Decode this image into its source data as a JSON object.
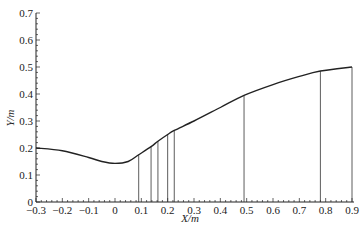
{
  "chart_data": {
    "type": "line",
    "title": "",
    "xlabel": "X/m",
    "ylabel": "Y/m",
    "xlim": [
      -0.3,
      0.9
    ],
    "ylim": [
      0,
      0.7
    ],
    "x_ticks": [
      "-0.3",
      "-0.2",
      "-0.1",
      "0",
      "0.1",
      "0.2",
      "0.3",
      "0.4",
      "0.5",
      "0.6",
      "0.7",
      "0.8",
      "0.9"
    ],
    "y_ticks": [
      "0",
      "0.1",
      "0.2",
      "0.3",
      "0.4",
      "0.5",
      "0.6",
      "0.7"
    ],
    "grid": false,
    "legend": null,
    "series": [
      {
        "name": "profile",
        "x": [
          -0.3,
          -0.2,
          -0.1,
          -0.05,
          0,
          0.05,
          0.09,
          0.137,
          0.163,
          0.2,
          0.225,
          0.3,
          0.4,
          0.49,
          0.6,
          0.7,
          0.78,
          0.9
        ],
        "y": [
          0.2,
          0.19,
          0.165,
          0.15,
          0.143,
          0.15,
          0.175,
          0.205,
          0.225,
          0.25,
          0.265,
          0.3,
          0.35,
          0.395,
          0.435,
          0.465,
          0.485,
          0.5
        ]
      }
    ],
    "vertical_lines": [
      {
        "x": 0.09,
        "y": 0.175
      },
      {
        "x": 0.137,
        "y": 0.205
      },
      {
        "x": 0.163,
        "y": 0.225
      },
      {
        "x": 0.2,
        "y": 0.25
      },
      {
        "x": 0.225,
        "y": 0.265
      },
      {
        "x": 0.49,
        "y": 0.395
      },
      {
        "x": 0.78,
        "y": 0.485
      },
      {
        "x": 0.9,
        "y": 0.5
      }
    ]
  }
}
